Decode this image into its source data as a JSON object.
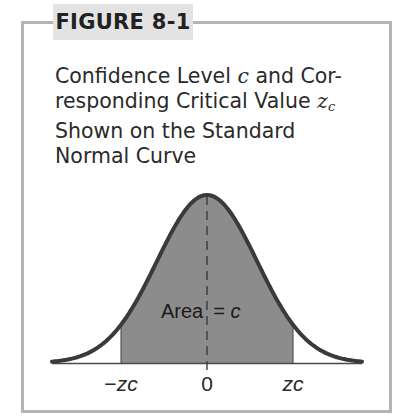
{
  "figure": {
    "label": "FIGURE 8-1",
    "title_lines": [
      [
        "Confidence Level ",
        "c",
        " and Cor-"
      ],
      [
        "responding Critical Value ",
        "z",
        "c"
      ],
      [
        "Shown on the Standard"
      ],
      [
        "Normal Curve"
      ]
    ],
    "title_text": "Confidence Level c and Corresponding Critical Value z_c Shown on the Standard Normal Curve",
    "area_label": {
      "word": "Area",
      "equals": "=",
      "symbol": "c"
    },
    "axis_labels": {
      "left": {
        "sign": "−",
        "symbol": "z",
        "sub": "c"
      },
      "center": "0",
      "right": {
        "symbol": "z",
        "sub": "c"
      }
    },
    "colors": {
      "border": "#b4b4b4",
      "label_bg": "#e3e3e3",
      "shade": "#8c8c8c",
      "curve": "#3a3a3a"
    }
  },
  "chart_data": {
    "type": "area",
    "xlabel": "",
    "ylabel": "",
    "distribution": "standard normal",
    "x_ticks": [
      "-z_c",
      "0",
      "z_c"
    ],
    "shaded_region": {
      "from": "-z_c",
      "to": "z_c",
      "label": "Area = c"
    },
    "center_line": {
      "x": 0,
      "style": "dashed"
    },
    "grid": false,
    "legend": null
  }
}
